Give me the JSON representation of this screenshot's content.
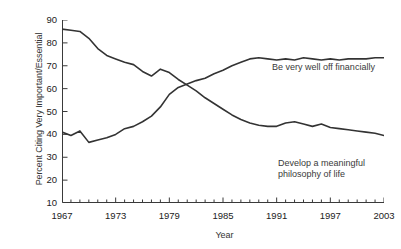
{
  "chart_data": {
    "type": "line",
    "title": "",
    "xlabel": "Year",
    "ylabel": "Percent Citing Very Important/Essential",
    "xlim": [
      1967,
      2003
    ],
    "ylim": [
      10,
      90
    ],
    "ytick_labels": [
      "90",
      "80",
      "70",
      "60",
      "50",
      "40",
      "30",
      "20",
      "10"
    ],
    "ytick_values": [
      90,
      80,
      70,
      60,
      50,
      40,
      30,
      20,
      10
    ],
    "xtick_labels": [
      "1967",
      "1973",
      "1979",
      "1985",
      "1991",
      "1997",
      "2003"
    ],
    "xtick_values": [
      1967,
      1973,
      1979,
      1985,
      1991,
      1997,
      2003
    ],
    "minor_xticks_every": 1,
    "grid": false,
    "legend": "inline-annotations",
    "x": [
      1967,
      1968,
      1969,
      1970,
      1971,
      1972,
      1973,
      1974,
      1975,
      1976,
      1977,
      1978,
      1979,
      1980,
      1981,
      1982,
      1983,
      1984,
      1985,
      1986,
      1987,
      1988,
      1989,
      1990,
      1991,
      1992,
      1993,
      1994,
      1995,
      1996,
      1997,
      1998,
      1999,
      2000,
      2001,
      2002,
      2003
    ],
    "series": [
      {
        "name": "Develop a meaningful philosophy of life",
        "label": "Develop a meaningful\nphilosophy of life",
        "color": "#333333",
        "values": [
          86,
          85.5,
          85,
          82,
          77.5,
          74.5,
          73,
          71.5,
          70.5,
          67.5,
          65.5,
          68.5,
          67,
          64,
          61.5,
          59,
          56,
          53.5,
          51,
          48.5,
          46.5,
          45,
          44,
          43.5,
          43.5,
          45,
          45.5,
          44.5,
          43.5,
          44.5,
          43,
          42.5,
          42,
          41.5,
          41,
          40.5,
          39.5
        ]
      },
      {
        "name": "Be very well off financially",
        "label": "Be very well off financially",
        "color": "#333333",
        "values": [
          41,
          39.5,
          41.5,
          36.5,
          37.5,
          38.5,
          40,
          42.5,
          43.5,
          45.5,
          48,
          52,
          57.5,
          60.5,
          62,
          63.5,
          64.5,
          66.5,
          68,
          70,
          71.5,
          73,
          73.5,
          73,
          72.5,
          73,
          72.5,
          73.5,
          73,
          72.5,
          73,
          72.5,
          73,
          73,
          73,
          73.5,
          73.5
        ]
      }
    ]
  },
  "axis_titles": {
    "y": "Percent Citing Very Important/Essential",
    "x": "Year"
  }
}
